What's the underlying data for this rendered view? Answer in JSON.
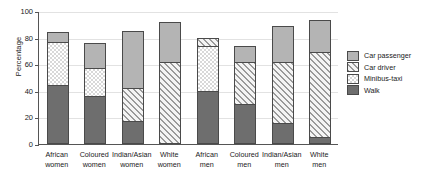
{
  "chart_data": {
    "type": "bar",
    "subtype": "stacked",
    "title": "",
    "xlabel": "",
    "ylabel": "Percentage",
    "ylim": [
      0,
      100
    ],
    "yticks": [
      0,
      20,
      40,
      60,
      80,
      100
    ],
    "grid": true,
    "legend_position": "right",
    "categories": [
      "African women",
      "Coloured women",
      "Indian/Asian women",
      "White women",
      "African men",
      "Coloured men",
      "Indian/Asian men",
      "White men"
    ],
    "category_lines": [
      [
        "African",
        "women"
      ],
      [
        "Coloured",
        "women"
      ],
      [
        "Indian/Asian",
        "women"
      ],
      [
        "White",
        "women"
      ],
      [
        "African",
        "men"
      ],
      [
        "Coloured",
        "men"
      ],
      [
        "Indian/Asian",
        "men"
      ],
      [
        "White",
        "men"
      ]
    ],
    "series": [
      {
        "name": "Walk",
        "key": "walk",
        "fill": "fill-walk",
        "values": [
          44,
          36,
          17,
          0,
          40,
          30,
          16,
          5
        ]
      },
      {
        "name": "Minibus-taxi",
        "key": "minibus",
        "fill": "fill-minibus",
        "values": [
          33,
          21,
          0,
          0,
          34,
          0,
          0,
          0
        ]
      },
      {
        "name": "Car driver",
        "key": "cardriver",
        "fill": "fill-cardriver",
        "values": [
          0,
          0,
          25,
          62,
          6,
          32,
          46,
          64
        ]
      },
      {
        "name": "Car passenger",
        "key": "carpass",
        "fill": "fill-carpass",
        "values": [
          7,
          19,
          43,
          30,
          0,
          12,
          27,
          24
        ]
      }
    ],
    "totals": [
      84,
      76,
      85,
      92,
      80,
      74,
      89,
      93
    ],
    "legend": [
      {
        "label": "Car passenger",
        "fill": "fill-carpass"
      },
      {
        "label": "Car driver",
        "fill": "fill-cardriver"
      },
      {
        "label": "Minibus-taxi",
        "fill": "fill-minibus"
      },
      {
        "label": "Walk",
        "fill": "fill-walk"
      }
    ],
    "colors": {
      "walk": "#6e6e6e",
      "car_passenger": "#b4b4b4",
      "minibus_taxi": "#e4e4e4",
      "car_driver": "#cfcfcf",
      "axis": "#555555",
      "grid": "#e2e2e2",
      "background": "#ffffff"
    }
  }
}
